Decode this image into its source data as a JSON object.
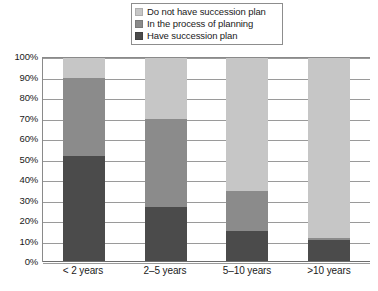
{
  "chart_data": {
    "type": "bar",
    "subtype": "100% stacked column",
    "title": "",
    "xlabel": "",
    "ylabel": "",
    "ylim": [
      0,
      100
    ],
    "yticks": [
      "0%",
      "10%",
      "20%",
      "30%",
      "40%",
      "50%",
      "60%",
      "70%",
      "80%",
      "90%",
      "100%"
    ],
    "grid": true,
    "legend_position": "top-center",
    "categories": [
      "< 2 years",
      "2–5 years",
      "5–10 years",
      ">10 years"
    ],
    "series": [
      {
        "name": "Do not have succession plan",
        "color": "#c6c6c6",
        "values": [
          10,
          30,
          65,
          88
        ]
      },
      {
        "name": "In the process of planning",
        "color": "#8b8b8b",
        "values": [
          38,
          43,
          20,
          1
        ]
      },
      {
        "name": "Have succession plan",
        "color": "#4b4b4b",
        "values": [
          52,
          27,
          15,
          11
        ]
      }
    ],
    "stack_order_bottom_to_top": [
      "Have succession plan",
      "In the process of planning",
      "Do not have succession plan"
    ]
  },
  "legend": {
    "items": [
      {
        "label": "Do not have succession plan",
        "swatch": "#c6c6c6"
      },
      {
        "label": "In the process of planning",
        "swatch": "#8b8b8b"
      },
      {
        "label": "Have succession plan",
        "swatch": "#4b4b4b"
      }
    ]
  }
}
